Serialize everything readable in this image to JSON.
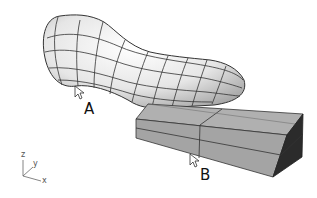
{
  "figure": {
    "objects": [
      {
        "name": "freeform-surface",
        "type": "nurbs-blob",
        "fill": "#e8e8e8",
        "isocurve_color": "#333333"
      },
      {
        "name": "box",
        "type": "solid-box",
        "fill": "#a9a9a9",
        "dark_face": "#2a2a2a"
      }
    ],
    "labels": {
      "a": "A",
      "b": "B"
    },
    "axis_gizmo": {
      "z": "z",
      "y": "y",
      "x": "x"
    }
  }
}
